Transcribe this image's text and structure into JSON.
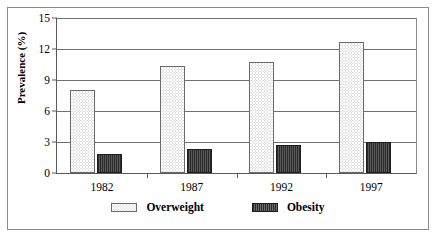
{
  "chart_data": {
    "type": "bar",
    "title": "",
    "xlabel": "",
    "ylabel": "Prevalence (%)",
    "categories": [
      "1982",
      "1987",
      "1992",
      "1997"
    ],
    "series": [
      {
        "name": "Overweight",
        "values": [
          8.0,
          10.4,
          10.7,
          12.7
        ]
      },
      {
        "name": "Obesity",
        "values": [
          1.8,
          2.3,
          2.7,
          3.0
        ]
      }
    ],
    "ylim": [
      0,
      15
    ],
    "yticks": [
      0,
      3,
      6,
      9,
      12,
      15
    ],
    "ytick_labels": [
      "0",
      "3",
      "6",
      "9",
      "12",
      "15"
    ],
    "grid": true,
    "legend_position": "bottom",
    "colors": {
      "overweight_fill": "#e3e3e3",
      "overweight_edge": "#6a6a6a",
      "obesity_fill": "#383838",
      "obesity_edge": "#1c1c1c",
      "gridline": "#707070",
      "axis": "#5a5a5a",
      "frame": "#8a8a8a",
      "background": "#ffffff",
      "text": "#000000"
    }
  },
  "legend": {
    "items": [
      {
        "label": "Overweight",
        "pattern": "light-dotted"
      },
      {
        "label": "Obesity",
        "pattern": "dark-vertical-stripes"
      }
    ]
  }
}
